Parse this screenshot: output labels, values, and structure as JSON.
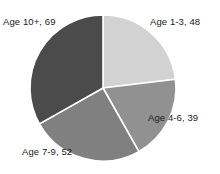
{
  "chart_data": {
    "type": "pie",
    "title": "",
    "subtitle": "",
    "xlabel": "",
    "ylabel": "",
    "legend_position": "none",
    "grid": false,
    "categories": [
      "Age 1-3",
      "Age 4-6",
      "Age 7-9",
      "Age 10+"
    ],
    "values": [
      48,
      39,
      52,
      69
    ],
    "total": 208,
    "start_angle_deg": 0,
    "direction": "clockwise",
    "slices": [
      {
        "label": "Age 1-3",
        "value": 48,
        "data_label": "Age 1-3, 48",
        "color": "#d2d2d2",
        "start_deg": 0.0,
        "sweep_deg": 83.08,
        "label_x": 150,
        "label_y": 16
      },
      {
        "label": "Age 4-6",
        "value": 39,
        "data_label": "Age 4-6, 39",
        "color": "#919191",
        "start_deg": 83.08,
        "sweep_deg": 67.5,
        "label_x": 148,
        "label_y": 112
      },
      {
        "label": "Age 7-9",
        "value": 52,
        "data_label": "Age 7-9, 52",
        "color": "#808080",
        "start_deg": 150.58,
        "sweep_deg": 90.0,
        "label_x": 22,
        "label_y": 146
      },
      {
        "label": "Age 10+",
        "value": 69,
        "data_label": "Age 10+, 69",
        "color": "#4b4b4b",
        "start_deg": 240.58,
        "sweep_deg": 119.42,
        "label_x": 3,
        "label_y": 16
      }
    ]
  },
  "geometry": {
    "center_x": 103,
    "center_y": 88,
    "radius": 73,
    "separator_color": "#ffffff",
    "separator_width": 1.6,
    "background": "#ffffff"
  },
  "labels": {
    "age_10_plus": "Age 10+, 69",
    "age_1_3": "Age 1-3, 48",
    "age_4_6": "Age 4-6, 39",
    "age_7_9": "Age 7-9, 52"
  }
}
